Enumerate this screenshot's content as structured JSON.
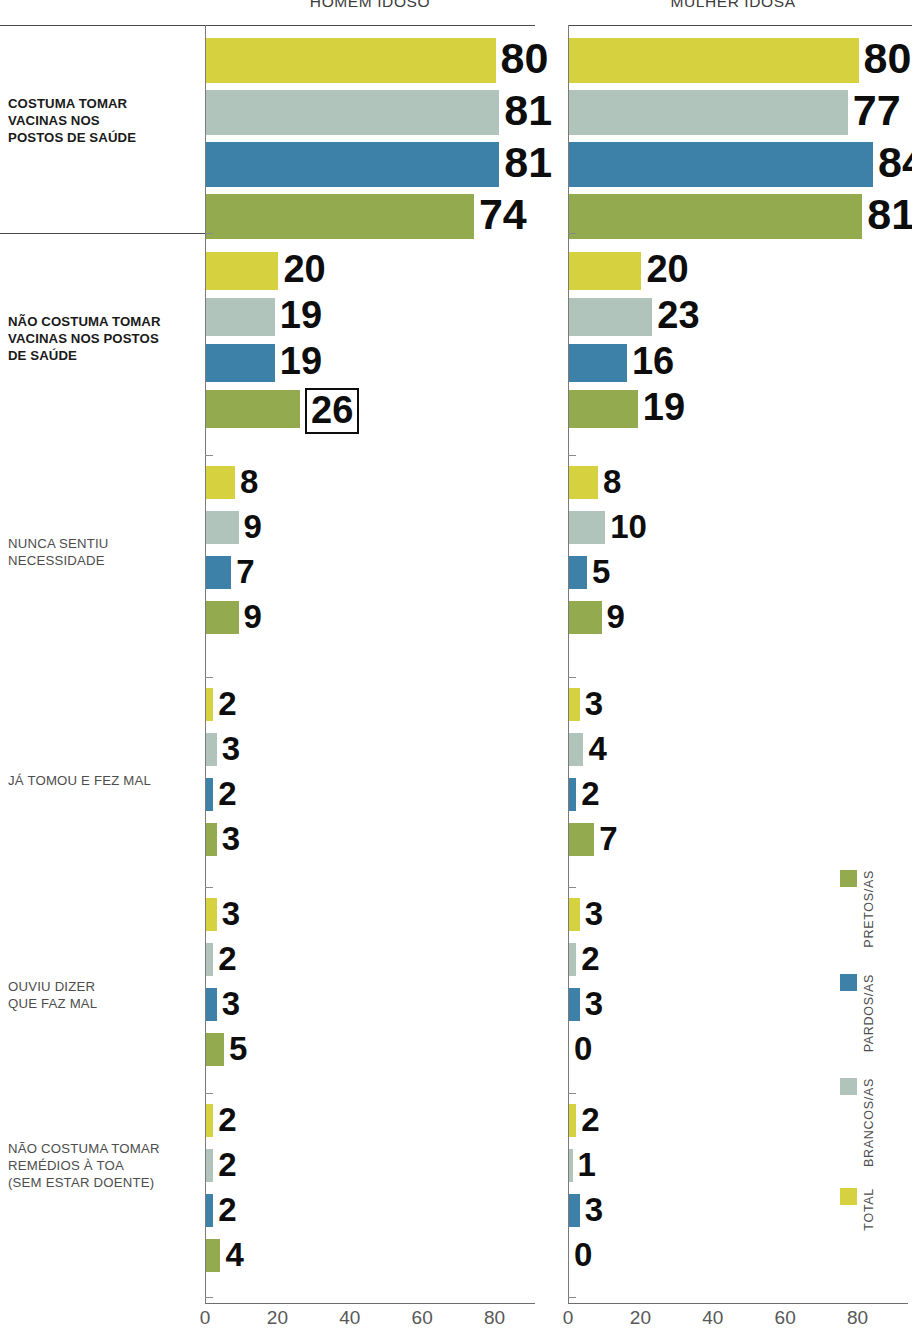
{
  "panels": [
    {
      "id": "left",
      "title": "HOMEM IDOSO"
    },
    {
      "id": "right",
      "title": "MULHER IDOSA"
    }
  ],
  "categories": [
    "COSTUMA TOMAR VACINAS NOS POSTOS DE SAÚDE",
    "NÃO COSTUMA TOMAR VACINAS NOS POSTOS DE SAÚDE",
    "NUNCA SENTIU NECESSIDADE",
    "JÁ TOMOU E FEZ MAL",
    "OUVIU DIZER QUE FAZ MAL",
    "NÃO COSTUMA TOMAR REMÉDIOS À TOA (SEM ESTAR DOENTE)"
  ],
  "category_lines": [
    [
      "COSTUMA TOMAR",
      "VACINAS NOS",
      "POSTOS DE SAÚDE"
    ],
    [
      "NÃO COSTUMA TOMAR",
      "VACINAS NOS POSTOS",
      "DE SAÚDE"
    ],
    [
      "NUNCA SENTIU",
      "NECESSIDADE"
    ],
    [
      "JÁ TOMOU E FEZ MAL"
    ],
    [
      "OUVIU DIZER",
      "QUE FAZ MAL"
    ],
    [
      "NÃO COSTUMA TOMAR",
      "REMÉDIOS À TOA",
      "(SEM ESTAR DOENTE)"
    ]
  ],
  "legend": {
    "position": "right-vertical",
    "items": [
      {
        "label": "PRETOS/AS",
        "color": "#93ab4e"
      },
      {
        "label": "PARDOS/AS",
        "color": "#3d81a8"
      },
      {
        "label": "BRANCOS/AS",
        "color": "#b0c4bc"
      },
      {
        "label": "TOTAL",
        "color": "#d5d13f"
      }
    ]
  },
  "series_order": [
    "TOTAL",
    "BRANCOS/AS",
    "PARDOS/AS",
    "PRETOS/AS"
  ],
  "series_colors": {
    "TOTAL": "#d5d13f",
    "BRANCOS/AS": "#b0c4bc",
    "PARDOS/AS": "#3d81a8",
    "PRETOS/AS": "#93ab4e"
  },
  "axis": {
    "ticks": [
      0,
      20,
      40,
      60,
      80
    ],
    "tick_labels": [
      "0",
      "20",
      "40",
      "60",
      "80"
    ],
    "min": 0,
    "max": 95,
    "grid": false
  },
  "highlight": {
    "panel": "left",
    "category_index": 1,
    "series": "PRETOS/AS",
    "value": 26
  },
  "chart_data": {
    "type": "bar",
    "title": "",
    "xlabel": "",
    "ylabel": "",
    "xlim": [
      0,
      95
    ],
    "grid": false,
    "orientation": "horizontal",
    "categories": [
      "COSTUMA TOMAR VACINAS NOS POSTOS DE SAÚDE",
      "NÃO COSTUMA TOMAR VACINAS NOS POSTOS DE SAÚDE",
      "NUNCA SENTIU NECESSIDADE",
      "JÁ TOMOU E FEZ MAL",
      "OUVIU DIZER QUE FAZ MAL",
      "NÃO COSTUMA TOMAR REMÉDIOS À TOA (SEM ESTAR DOENTE)"
    ],
    "panels": [
      {
        "name": "HOMEM IDOSO",
        "series": [
          {
            "name": "TOTAL",
            "values": [
              80,
              20,
              8,
              2,
              3,
              2
            ]
          },
          {
            "name": "BRANCOS/AS",
            "values": [
              81,
              19,
              9,
              3,
              2,
              2
            ]
          },
          {
            "name": "PARDOS/AS",
            "values": [
              81,
              19,
              7,
              2,
              3,
              2
            ]
          },
          {
            "name": "PRETOS/AS",
            "values": [
              74,
              26,
              9,
              3,
              5,
              4
            ]
          }
        ]
      },
      {
        "name": "MULHER IDOSA",
        "series": [
          {
            "name": "TOTAL",
            "values": [
              80,
              20,
              8,
              3,
              3,
              2
            ]
          },
          {
            "name": "BRANCOS/AS",
            "values": [
              77,
              23,
              10,
              4,
              2,
              1
            ]
          },
          {
            "name": "PARDOS/AS",
            "values": [
              84,
              16,
              5,
              2,
              3,
              3
            ]
          },
          {
            "name": "PRETOS/AS",
            "values": [
              81,
              19,
              9,
              7,
              0,
              0
            ]
          }
        ]
      }
    ]
  }
}
